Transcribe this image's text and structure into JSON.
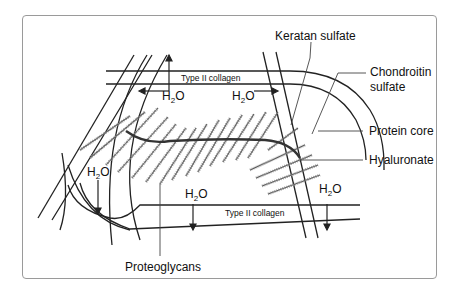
{
  "diagram": {
    "labels": {
      "keratan_sulfate": "Keratan sulfate",
      "chondroitin_line1": "Chondroitin",
      "chondroitin_line2": "sulfate",
      "protein_core": "Protein core",
      "hyaluronate": "Hyaluronate",
      "proteoglycans": "Proteoglycans",
      "collagen_top": "Type II collagen",
      "collagen_bottom": "Type II collagen"
    },
    "water": {
      "h": "H",
      "sub": "2",
      "o": "O",
      "instances": [
        "top-left",
        "top-right",
        "left",
        "bottom-center",
        "bottom-right"
      ]
    },
    "colors": {
      "line": "#222222",
      "frame": "#9a9a9a",
      "gag_fuzz": "#7a7a7a",
      "leader": "#555555"
    }
  }
}
